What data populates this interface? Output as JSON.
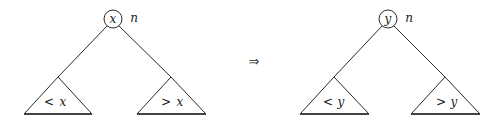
{
  "diagram": {
    "type": "binary-search-tree-node-replacement",
    "arrow": "⇒",
    "before": {
      "node_key": "x",
      "node_label": "n",
      "left_subtree": {
        "relation": "<",
        "key": "x"
      },
      "right_subtree": {
        "relation": ">",
        "key": "x"
      }
    },
    "after": {
      "node_key": "y",
      "node_label": "n",
      "left_subtree": {
        "relation": "<",
        "key": "y"
      },
      "right_subtree": {
        "relation": ">",
        "key": "y"
      }
    }
  }
}
